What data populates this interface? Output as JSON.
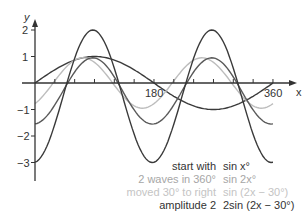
{
  "chart_data": {
    "type": "line",
    "title": "",
    "xlabel": "x",
    "ylabel": "y",
    "xlim": [
      0,
      360
    ],
    "ylim": [
      -3.5,
      2.3
    ],
    "x_ticks": [
      {
        "value": 180,
        "label": "180"
      },
      {
        "value": 360,
        "label": "360"
      }
    ],
    "y_ticks": [
      {
        "value": 2,
        "label": "2"
      },
      {
        "value": 1,
        "label": "1"
      },
      {
        "value": -1,
        "label": "−1"
      },
      {
        "value": -2,
        "label": "−2"
      },
      {
        "value": -3,
        "label": "−3"
      }
    ],
    "grid": false,
    "legend_position": "bottom-right",
    "series": [
      {
        "name": "start with",
        "formula": "sin x°",
        "color": "#3a3a3a",
        "amp": 1.0,
        "freq": 1,
        "phase": 0,
        "offset": 0
      },
      {
        "name": "2 waves in 360°",
        "formula": "sin 2x°",
        "color": "#bdbdbd",
        "amp": 0.95,
        "freq": 2,
        "phase": -55,
        "offset": 0
      },
      {
        "name": "moved 30° to right",
        "formula": "sin (2x − 30°)",
        "color": "#5a5a5a",
        "amp": 1.25,
        "freq": 2,
        "phase": -85,
        "offset": -0.3
      },
      {
        "name": "amplitude 2",
        "formula": "2sin (2x − 30°)",
        "color": "#3a3a3a",
        "amp": 2.5,
        "freq": 2,
        "phase": -85,
        "offset": -0.5
      }
    ]
  },
  "axis": {
    "x_label": "x",
    "y_label": "y"
  },
  "legend": [
    {
      "desc": "start with",
      "formula": "sin x°",
      "color": "#333333"
    },
    {
      "desc": "2 waves in 360°",
      "formula": "sin 2x°",
      "color": "#a6a6a6"
    },
    {
      "desc": "moved 30° to right",
      "formula": "sin (2x − 30°)",
      "color": "#c4c4c4"
    },
    {
      "desc": "amplitude 2",
      "formula": "2sin (2x − 30°)",
      "color": "#333333"
    }
  ]
}
